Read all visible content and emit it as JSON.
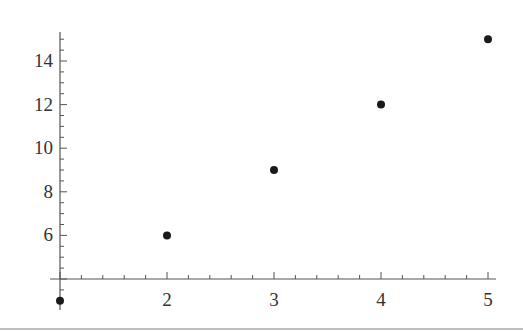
{
  "chart_data": {
    "type": "scatter",
    "title": "",
    "xlabel": "",
    "ylabel": "",
    "x": [
      1,
      2,
      3,
      4,
      5
    ],
    "y": [
      3,
      6,
      9,
      12,
      15
    ],
    "series": [
      {
        "name": "data",
        "x": [
          1,
          2,
          3,
          4,
          5
        ],
        "y": [
          3,
          6,
          9,
          12,
          15
        ]
      }
    ],
    "x_ticks": [
      2,
      3,
      4,
      5
    ],
    "y_ticks": [
      6,
      8,
      10,
      12,
      14
    ],
    "xlim": [
      1,
      5
    ],
    "ylim": [
      4,
      15.5
    ],
    "axes_origin": [
      1,
      4
    ],
    "grid": false,
    "legend": null,
    "marker_color": "#1a1a1a",
    "axis_color": "#555555"
  }
}
